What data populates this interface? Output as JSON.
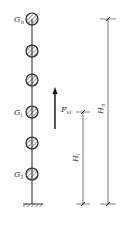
{
  "diagram": {
    "type": "multi-mass cantilever model (lumped mass column)",
    "masses": [
      {
        "label_main": "G",
        "label_sub": "n",
        "y": 19
      },
      {
        "label_main": "",
        "label_sub": "",
        "y": 51
      },
      {
        "label_main": "",
        "label_sub": "",
        "y": 80
      },
      {
        "label_main": "G",
        "label_sub": "i",
        "y": 112
      },
      {
        "label_main": "",
        "label_sub": "",
        "y": 143
      },
      {
        "label_main": "G",
        "label_sub": "1",
        "y": 174
      }
    ],
    "force": {
      "label_main": "F",
      "label_sub": "vi",
      "direction": "up"
    },
    "dimensions": [
      {
        "label_main": "H",
        "label_sub": "i",
        "from": "G_i",
        "to": "ground"
      },
      {
        "label_main": "H",
        "label_sub": "n",
        "from": "G_n",
        "to": "ground"
      }
    ],
    "colors": {
      "line": "#222222",
      "dim_line": "#555555",
      "hatch": "#444444"
    }
  }
}
